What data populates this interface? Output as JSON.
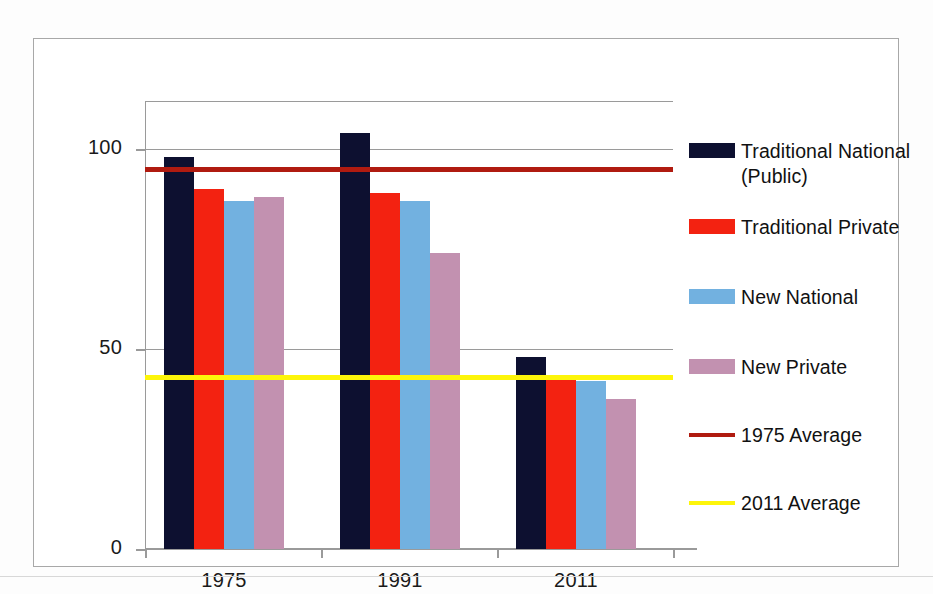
{
  "chart_data": {
    "type": "bar",
    "title": "",
    "subtitle": "",
    "xlabel": "",
    "ylabel": "",
    "categories": [
      "1975",
      "1991",
      "2011"
    ],
    "series": [
      {
        "name": "Traditional National\n(Public)",
        "color": "#0d1030",
        "values": [
          98,
          104,
          48
        ]
      },
      {
        "name": "Traditional Private",
        "color": "#f32211",
        "values": [
          90,
          89,
          43
        ]
      },
      {
        "name": "New National",
        "color": "#72b1e0",
        "values": [
          87,
          87,
          42
        ]
      },
      {
        "name": "New Private",
        "color": "#c291b0",
        "values": [
          88,
          74,
          37.5
        ]
      }
    ],
    "reference_lines": [
      {
        "name": "1975 Average",
        "color": "#b01b10",
        "value": 95
      },
      {
        "name": "2011 Average",
        "color": "#fdf50a",
        "value": 43
      }
    ],
    "ylim": [
      0,
      112
    ],
    "yticks": [
      0,
      50,
      100
    ],
    "ytick_labels": [
      "0",
      "50",
      "100"
    ],
    "grid": true,
    "grid_axis": "y",
    "legend_position": "right"
  },
  "legend": {
    "entries": [
      {
        "label": "Traditional National\n(Public)",
        "swatch": "box",
        "color": "#0d1030"
      },
      {
        "label": "Traditional Private",
        "swatch": "box",
        "color": "#f32211"
      },
      {
        "label": "New National",
        "swatch": "box",
        "color": "#72b1e0"
      },
      {
        "label": "New Private",
        "swatch": "box",
        "color": "#c291b0"
      },
      {
        "label": "1975 Average",
        "swatch": "line",
        "color": "#b01b10"
      },
      {
        "label": "2011 Average",
        "swatch": "line",
        "color": "#fdf50a"
      }
    ]
  },
  "axes": {
    "y_labels": [
      "100",
      "50",
      "0"
    ],
    "x_labels": [
      "1975",
      "1991",
      "2011"
    ]
  },
  "colors": {
    "traditional_national": "#0d1030",
    "traditional_private": "#f32211",
    "new_national": "#72b1e0",
    "new_private": "#c291b0",
    "average_1975": "#b01b10",
    "average_2011": "#fdf50a",
    "grid": "#9a9a9a",
    "frame": "#a8a8a8"
  }
}
